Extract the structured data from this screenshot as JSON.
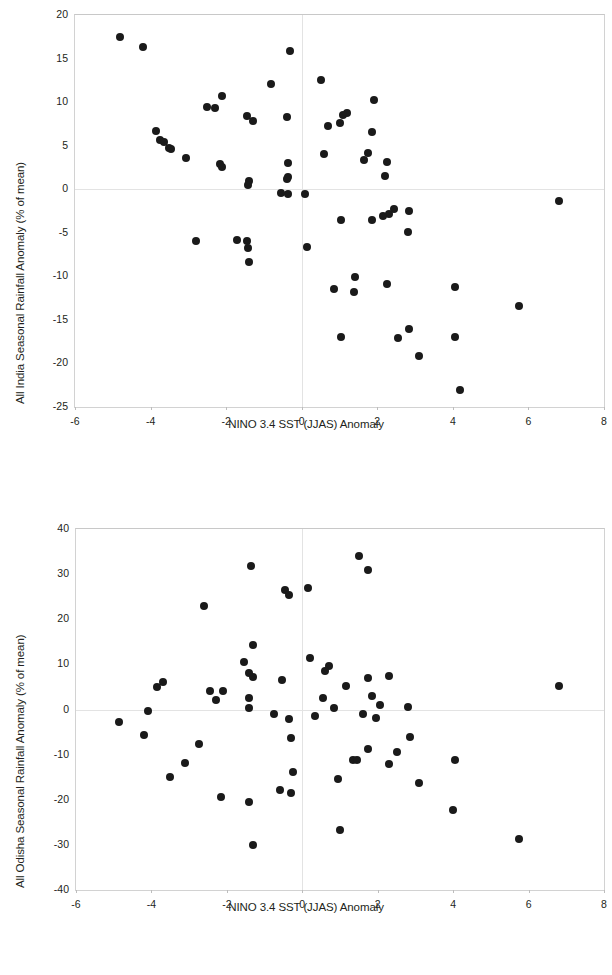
{
  "figure": {
    "background_color": "#ffffff",
    "marker_color": "#1a1a1a",
    "grid_color": "#e3e3e3",
    "axis_color": "#d2d2d2"
  },
  "chart_data": [
    {
      "type": "scatter",
      "id": "all-india",
      "title": "",
      "xlabel": "NINO 3.4 SST (JJAS) Anomaly",
      "ylabel": "All India Seasonal Rainfall Anomaly (% of mean)",
      "xlim": [
        -6,
        8
      ],
      "ylim": [
        -25,
        20
      ],
      "xticks": [
        -6,
        -4,
        -2,
        0,
        2,
        4,
        6,
        8
      ],
      "xtick_labels": [
        "-6",
        "-4",
        "-2",
        "0",
        "2",
        "4",
        "6",
        "8"
      ],
      "yticks": [
        20,
        15,
        10,
        5,
        0,
        -5,
        -10,
        -15,
        -20,
        -25
      ],
      "ytick_labels": [
        "20",
        "15",
        "10",
        "5",
        "0",
        "-5",
        "-10",
        "-15",
        "-20",
        "-25"
      ],
      "grid": true,
      "legend": null,
      "marker_size": 8,
      "points": [
        [
          -4.8,
          17.5
        ],
        [
          -4.2,
          16.3
        ],
        [
          -0.3,
          15.9
        ],
        [
          -0.8,
          12.1
        ],
        [
          0.5,
          12.5
        ],
        [
          -2.1,
          10.7
        ],
        [
          1.9,
          10.2
        ],
        [
          -2.5,
          9.4
        ],
        [
          -2.3,
          9.3
        ],
        [
          1.2,
          8.8
        ],
        [
          1.1,
          8.5
        ],
        [
          -1.45,
          8.4
        ],
        [
          -0.4,
          8.3
        ],
        [
          -1.3,
          7.8
        ],
        [
          1.0,
          7.6
        ],
        [
          0.7,
          7.3
        ],
        [
          -3.85,
          6.7
        ],
        [
          1.85,
          6.6
        ],
        [
          -3.75,
          5.7
        ],
        [
          -3.65,
          5.4
        ],
        [
          -3.5,
          4.7
        ],
        [
          -3.45,
          4.6
        ],
        [
          0.6,
          4.1
        ],
        [
          1.75,
          4.2
        ],
        [
          -3.05,
          3.6
        ],
        [
          1.65,
          3.4
        ],
        [
          2.25,
          3.1
        ],
        [
          -0.35,
          3.0
        ],
        [
          -2.15,
          2.9
        ],
        [
          -2.1,
          2.6
        ],
        [
          2.2,
          1.5
        ],
        [
          -0.35,
          1.4
        ],
        [
          -0.38,
          1.2
        ],
        [
          -1.4,
          1.0
        ],
        [
          -1.42,
          0.5
        ],
        [
          -0.55,
          -0.4
        ],
        [
          -0.35,
          -0.6
        ],
        [
          0.1,
          -0.5
        ],
        [
          6.8,
          -1.3
        ],
        [
          2.45,
          -2.3
        ],
        [
          2.85,
          -2.5
        ],
        [
          2.3,
          -2.9
        ],
        [
          2.15,
          -3.1
        ],
        [
          1.05,
          -3.5
        ],
        [
          1.85,
          -3.5
        ],
        [
          2.8,
          -4.9
        ],
        [
          -2.8,
          -6.0
        ],
        [
          -1.7,
          -5.8
        ],
        [
          -1.45,
          -6.0
        ],
        [
          -1.42,
          -6.8
        ],
        [
          0.15,
          -6.6
        ],
        [
          -1.4,
          -8.4
        ],
        [
          1.4,
          -10.1
        ],
        [
          2.25,
          -10.9
        ],
        [
          4.05,
          -11.2
        ],
        [
          0.85,
          -11.5
        ],
        [
          1.38,
          -11.8
        ],
        [
          5.75,
          -13.4
        ],
        [
          2.85,
          -16.1
        ],
        [
          1.05,
          -17.0
        ],
        [
          2.55,
          -17.1
        ],
        [
          4.05,
          -17.0
        ],
        [
          3.1,
          -19.2
        ],
        [
          4.2,
          -23.1
        ]
      ]
    },
    {
      "type": "scatter",
      "id": "all-odisha",
      "title": "",
      "xlabel": "NINO 3.4 SST (JJAS) Anomaly",
      "ylabel": "All Odisha Seasonal Rainfall Anomaly (% of mean)",
      "xlim": [
        -6,
        8
      ],
      "ylim": [
        -40,
        40
      ],
      "xticks": [
        -6,
        -4,
        -2,
        0,
        2,
        4,
        6,
        8
      ],
      "xtick_labels": [
        "-6",
        "-4",
        "-2",
        "0",
        "2",
        "4",
        "6",
        "8"
      ],
      "yticks": [
        40,
        30,
        20,
        10,
        0,
        -10,
        -20,
        -30,
        -40
      ],
      "ytick_labels": [
        "40",
        "30",
        "20",
        "10",
        "0",
        "-10",
        "-20",
        "-30",
        "-40"
      ],
      "grid": true,
      "legend": null,
      "marker_size": 8,
      "points": [
        [
          1.5,
          34.0
        ],
        [
          -1.35,
          31.8
        ],
        [
          1.75,
          30.9
        ],
        [
          0.15,
          26.9
        ],
        [
          -0.45,
          26.4
        ],
        [
          -0.35,
          25.4
        ],
        [
          -2.6,
          22.9
        ],
        [
          -1.3,
          14.3
        ],
        [
          -1.55,
          10.6
        ],
        [
          0.2,
          11.4
        ],
        [
          -1.4,
          8.1
        ],
        [
          0.7,
          9.6
        ],
        [
          -1.3,
          7.1
        ],
        [
          0.6,
          8.5
        ],
        [
          -0.55,
          6.5
        ],
        [
          1.75,
          6.9
        ],
        [
          2.3,
          7.5
        ],
        [
          -3.7,
          6.1
        ],
        [
          -3.85,
          5.0
        ],
        [
          1.15,
          5.2
        ],
        [
          6.8,
          5.1
        ],
        [
          -2.45,
          4.0
        ],
        [
          -2.1,
          4.1
        ],
        [
          -2.3,
          2.2
        ],
        [
          -1.4,
          2.6
        ],
        [
          0.55,
          2.5
        ],
        [
          1.85,
          2.9
        ],
        [
          2.05,
          1.1
        ],
        [
          2.8,
          0.5
        ],
        [
          0.85,
          0.3
        ],
        [
          -1.42,
          0.4
        ],
        [
          -4.1,
          -0.3
        ],
        [
          -0.75,
          -1.0
        ],
        [
          0.35,
          -1.4
        ],
        [
          1.6,
          -1.1
        ],
        [
          -0.35,
          -2.1
        ],
        [
          1.95,
          -1.9
        ],
        [
          -4.85,
          -2.7
        ],
        [
          -4.2,
          -5.6
        ],
        [
          -0.3,
          -6.4
        ],
        [
          2.85,
          -6.0
        ],
        [
          -2.75,
          -7.7
        ],
        [
          1.75,
          -8.7
        ],
        [
          2.5,
          -9.4
        ],
        [
          -3.1,
          -11.8
        ],
        [
          1.35,
          -11.2
        ],
        [
          1.45,
          -11.3
        ],
        [
          2.3,
          -12.0
        ],
        [
          4.05,
          -11.1
        ],
        [
          -0.25,
          -13.8
        ],
        [
          -3.5,
          -15.0
        ],
        [
          0.95,
          -15.4
        ],
        [
          3.1,
          -16.3
        ],
        [
          -0.6,
          -17.8
        ],
        [
          -0.3,
          -18.4
        ],
        [
          -2.15,
          -19.3
        ],
        [
          -1.4,
          -20.5
        ],
        [
          4.0,
          -22.3
        ],
        [
          1.0,
          -26.6
        ],
        [
          5.75,
          -28.7
        ],
        [
          -1.3,
          -30.1
        ]
      ]
    }
  ]
}
